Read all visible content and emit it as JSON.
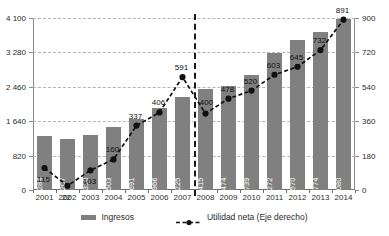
{
  "chart_data": {
    "type": "bar",
    "title": "",
    "subtitle": "",
    "xlabel": "",
    "ylabel": "",
    "categories": [
      "2001",
      "2002",
      "2003",
      "2004",
      "2005",
      "2006",
      "2007",
      "2008",
      "2009",
      "2010",
      "2011",
      "2012",
      "2013",
      "2014"
    ],
    "series": [
      {
        "name": "Ingresos",
        "type": "bar",
        "axis": "left",
        "color": "#808080",
        "values": [
          1284,
          1207,
          1318,
          1503,
          1691,
          1966,
          2225,
          2415,
          2474,
          2739,
          3272,
          3570,
          3774,
          4080
        ],
        "value_labels": [
          "1 284",
          "1 207",
          "1 318",
          "1 503",
          "1 691",
          "1 966",
          "2 225",
          "2 415",
          "2 474",
          "2 739",
          "3 272",
          "3 570",
          "3 774",
          "4 080"
        ]
      },
      {
        "name": "Utilidad neta (Eje derecho)",
        "type": "line",
        "axis": "right",
        "color": "#111111",
        "values": [
          115,
          22,
          103,
          160,
          337,
          406,
          591,
          400,
          478,
          520,
          603,
          645,
          732,
          891
        ],
        "value_labels": [
          "115",
          "22",
          "103",
          "160",
          "337",
          "406",
          "591",
          "400",
          "478",
          "520",
          "603",
          "645",
          "732",
          "891"
        ]
      }
    ],
    "left_axis": {
      "min": 0,
      "max": 4100,
      "ticks": [
        0,
        820,
        1640,
        2460,
        3280,
        4100
      ],
      "tick_labels": [
        "0",
        "820",
        "1 640",
        "2 460",
        "3 280",
        "4 100"
      ]
    },
    "right_axis": {
      "min": 0,
      "max": 900,
      "ticks": [
        0,
        180,
        360,
        540,
        720,
        900
      ],
      "tick_labels": [
        "0",
        "180",
        "360",
        "540",
        "720",
        "900"
      ]
    },
    "grid": true,
    "legend_position": "bottom",
    "annotations": [
      {
        "type": "vertical-divider",
        "after_category": "2007",
        "style": "dashed"
      }
    ]
  },
  "legend": {
    "items": [
      {
        "label": "Ingresos",
        "marker": "bar-swatch",
        "color": "#808080"
      },
      {
        "label": "Utilidad neta (Eje derecho)",
        "marker": "dashed-line-marker",
        "color": "#111111"
      }
    ]
  }
}
